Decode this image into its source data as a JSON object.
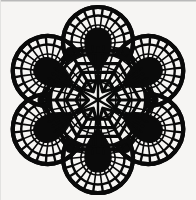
{
  "image": {
    "title": "Six-lobed lace rosette motif",
    "subject": "lace-doily-rosette",
    "style": "black-and-white line art",
    "width": 196,
    "height": 200
  },
  "colors": {
    "background": "#f6f5f3",
    "ink": "#0a0a0a",
    "page_border": "#b9b9b9",
    "paper_tint": "#efeeec"
  },
  "geometry": {
    "center_x": 98,
    "center_y": 100,
    "outer_radius": 91,
    "lobe_count": 6,
    "lobe_angles_deg": [
      30,
      90,
      150,
      210,
      270,
      330
    ],
    "lobe_center_radius": 58,
    "lobe_radius": 35,
    "scallop_count_per_lobe": 15,
    "spoke_count_per_lobe": 15,
    "bowtie_count": 6,
    "bowtie_angles_deg": [
      0,
      60,
      120,
      180,
      240,
      300
    ],
    "bowtie_radius": 57,
    "hex_ring_radii": [
      12,
      22,
      32,
      42,
      52
    ],
    "center_star_points": 6,
    "teardrop_count": 6
  },
  "rendering": {
    "stroke_thin": 1.6,
    "stroke_medium": 2.4,
    "stroke_thick": 3.2,
    "stroke_outline": 4.2
  },
  "labels": {
    "artwork": "rosette-lace-motif",
    "caption": ""
  }
}
